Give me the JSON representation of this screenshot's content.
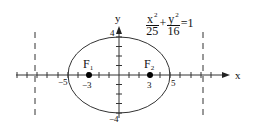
{
  "equation": {
    "term1": {
      "numerator": "x",
      "exponent": "2",
      "denominator": "25"
    },
    "plus": "+",
    "term2": {
      "numerator": "y",
      "exponent": "2",
      "denominator": "16"
    },
    "equals": "=1"
  },
  "axes": {
    "x_label": "x",
    "y_label": "y"
  },
  "ellipse": {
    "a": 5,
    "b": 4,
    "c": 3
  },
  "tick_labels": {
    "x_neg5": "−5",
    "x_pos5": "5",
    "y_pos4": "4",
    "y_neg4": "−4"
  },
  "foci": [
    {
      "label": "F",
      "subscript": "1",
      "x_value_label": "−3"
    },
    {
      "label": "F",
      "subscript": "2",
      "x_value_label": "3"
    }
  ],
  "directrices": {
    "style": "dashed",
    "x_positions": [
      -8.33,
      8.33
    ]
  },
  "colors": {
    "stroke": "#333333",
    "points": "#000000",
    "background": "#ffffff"
  }
}
